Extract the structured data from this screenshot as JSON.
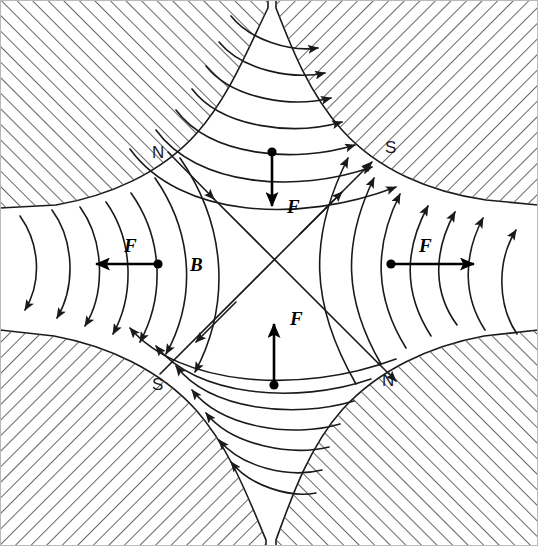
{
  "figure": {
    "type": "physics-field-diagram",
    "canvas": {
      "width": 538,
      "height": 546
    },
    "background_color": "#ffffff",
    "line_color": "#1a1a1a",
    "hatch_color": "#555555"
  },
  "poles": [
    {
      "id": "pole-top-left",
      "label": "N",
      "polarity": "north",
      "corner": "top-left",
      "hatch_direction": "forward-slash",
      "label_x": 157,
      "label_y": 157
    },
    {
      "id": "pole-top-right",
      "label": "S",
      "polarity": "south",
      "corner": "top-right",
      "hatch_direction": "back-slash",
      "label_x": 390,
      "label_y": 152
    },
    {
      "id": "pole-bottom-left",
      "label": "S",
      "polarity": "south",
      "corner": "bottom-left",
      "hatch_direction": "back-slash",
      "label_x": 158,
      "label_y": 389
    },
    {
      "id": "pole-bottom-right",
      "label": "N",
      "polarity": "north",
      "corner": "bottom-right",
      "hatch_direction": "forward-slash",
      "label_x": 387,
      "label_y": 385
    }
  ],
  "vectors": [
    {
      "id": "force-top",
      "label": "F",
      "quantity": "force",
      "direction": "down",
      "origin_x": 272,
      "origin_y": 152,
      "tip_x": 272,
      "tip_y": 214,
      "label_x": 287,
      "label_y": 213
    },
    {
      "id": "force-left",
      "label": "F",
      "quantity": "force",
      "direction": "left",
      "origin_x": 158,
      "origin_y": 264,
      "tip_x": 88,
      "tip_y": 264,
      "label_x": 130,
      "label_y": 252
    },
    {
      "id": "force-right",
      "label": "F",
      "quantity": "force",
      "direction": "right",
      "origin_x": 391,
      "origin_y": 264,
      "tip_x": 482,
      "tip_y": 264,
      "label_x": 423,
      "label_y": 252
    },
    {
      "id": "force-bottom",
      "label": "F",
      "quantity": "force",
      "direction": "up",
      "origin_x": 274,
      "origin_y": 385,
      "tip_x": 274,
      "tip_y": 316,
      "label_x": 290,
      "label_y": 323
    }
  ],
  "field_label": {
    "id": "field-b",
    "label": "B",
    "quantity": "magnetic-flux-density",
    "label_x": 190,
    "label_y": 271
  },
  "field_regions": [
    {
      "id": "field-top",
      "from_pole": "N (top-left)",
      "to_pole": "S (top-right)",
      "arrow_direction": "rightward",
      "line_count": 7
    },
    {
      "id": "field-right",
      "from_pole": "N (bottom-right)",
      "to_pole": "S (top-right)",
      "arrow_direction": "upward",
      "line_count": 7
    },
    {
      "id": "field-bottom",
      "from_pole": "N (bottom-right)",
      "to_pole": "S (bottom-left)",
      "arrow_direction": "leftward",
      "line_count": 7
    },
    {
      "id": "field-left",
      "from_pole": "N (top-left)",
      "to_pole": "S (bottom-left)",
      "arrow_direction": "downward",
      "line_count": 7
    },
    {
      "id": "field-diagonal-nw-se",
      "from_pole": "N (top-left)",
      "to_pole": "S (bottom-left)",
      "arrow_direction": "down-right then down-left",
      "line_count": 1
    },
    {
      "id": "field-diagonal-ne-sw",
      "from_pole": "N (bottom-right)",
      "to_pole": "S (top-right)",
      "arrow_direction": "up-right",
      "line_count": 1
    }
  ]
}
